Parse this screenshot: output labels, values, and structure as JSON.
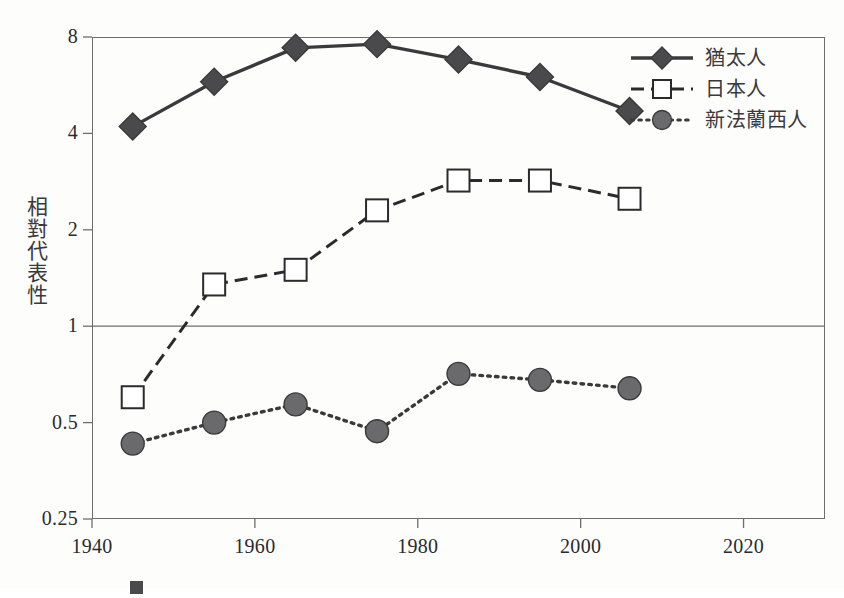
{
  "chart_data": {
    "type": "line",
    "title": "",
    "subtitle": "",
    "xlabel": "",
    "ylabel": "相對代表性",
    "xlim": [
      1940,
      2030
    ],
    "ylim": [
      0.25,
      8
    ],
    "yscale": "log",
    "grid": false,
    "reference_lines": [
      {
        "axis": "y",
        "value": 1
      }
    ],
    "legend_position": "top-right",
    "xticks": [
      "1940",
      "1960",
      "1980",
      "2000",
      "2020"
    ],
    "xtick_values": [
      1940,
      1960,
      1980,
      2000,
      2020
    ],
    "yticks": [
      "0.25",
      "0.5",
      "1",
      "2",
      "4",
      "8"
    ],
    "ytick_values": [
      0.25,
      0.5,
      1,
      2,
      4,
      8
    ],
    "x": [
      1945,
      1955,
      1965,
      1975,
      1985,
      1995,
      2006
    ],
    "series": [
      {
        "name": "猶太人",
        "marker": "diamond",
        "line": "solid",
        "color": "#3a3a3c",
        "fill": "#4a4a4c",
        "values": [
          4.2,
          5.8,
          7.4,
          7.6,
          6.8,
          6.0,
          4.7
        ]
      },
      {
        "name": "日本人",
        "marker": "square",
        "line": "dashed",
        "color": "#2b2b2d",
        "fill": "#ffffff",
        "values": [
          0.6,
          1.35,
          1.5,
          2.3,
          2.85,
          2.85,
          2.5
        ]
      },
      {
        "name": "新法蘭西人",
        "marker": "circle",
        "line": "dotted",
        "color": "#3a3a3c",
        "fill": "#6a6a6c",
        "values": [
          0.43,
          0.5,
          0.57,
          0.47,
          0.71,
          0.68,
          0.64
        ]
      }
    ]
  },
  "axis": {
    "y_title": "相對代表性",
    "ytick_labels": [
      "8",
      "4",
      "2",
      "1",
      "0.5",
      "0.25"
    ],
    "xtick_labels": [
      "1940",
      "1960",
      "1980",
      "2000",
      "2020"
    ]
  },
  "legend": {
    "items": [
      {
        "label": "猶太人",
        "marker": "diamond",
        "line": "solid"
      },
      {
        "label": "日本人",
        "marker": "square",
        "line": "dashed"
      },
      {
        "label": "新法蘭西人",
        "marker": "circle",
        "line": "dotted"
      }
    ]
  },
  "caption": {
    "text": ""
  },
  "colors": {
    "frame": "#6e6e70",
    "text": "#2b2b2d",
    "diamond_fill": "#4a4a4c",
    "square_fill": "#ffffff",
    "circle_fill": "#6a6a6c",
    "reference_line": "#6e6e70"
  }
}
